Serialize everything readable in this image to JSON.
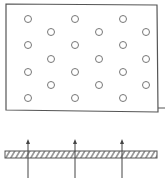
{
  "diagram": {
    "colors": {
      "stroke": "#555555",
      "circle": "#777777",
      "background": "#ffffff"
    },
    "plate": {
      "x": 6,
      "y": 4,
      "width": 151,
      "height": 107
    },
    "holes": [
      {
        "cx": 28,
        "cy": 19
      },
      {
        "cx": 75,
        "cy": 19
      },
      {
        "cx": 123,
        "cy": 19
      },
      {
        "cx": 51,
        "cy": 32
      },
      {
        "cx": 99,
        "cy": 32
      },
      {
        "cx": 146,
        "cy": 32
      },
      {
        "cx": 28,
        "cy": 45
      },
      {
        "cx": 75,
        "cy": 45
      },
      {
        "cx": 123,
        "cy": 45
      },
      {
        "cx": 51,
        "cy": 59
      },
      {
        "cx": 99,
        "cy": 59
      },
      {
        "cx": 146,
        "cy": 59
      },
      {
        "cx": 28,
        "cy": 72
      },
      {
        "cx": 75,
        "cy": 72
      },
      {
        "cx": 123,
        "cy": 72
      },
      {
        "cx": 51,
        "cy": 85
      },
      {
        "cx": 99,
        "cy": 85
      },
      {
        "cx": 146,
        "cy": 85
      },
      {
        "cx": 28,
        "cy": 98
      },
      {
        "cx": 75,
        "cy": 98
      },
      {
        "cx": 123,
        "cy": 98
      }
    ],
    "hole_radius": 3.5,
    "section_bar": {
      "x": 5,
      "y": 151,
      "width": 152,
      "height": 7
    },
    "arrows": [
      {
        "x": 28,
        "y_from": 178,
        "y_to": 139
      },
      {
        "x": 75,
        "y_from": 178,
        "y_to": 139
      },
      {
        "x": 122,
        "y_from": 178,
        "y_to": 139
      }
    ]
  }
}
